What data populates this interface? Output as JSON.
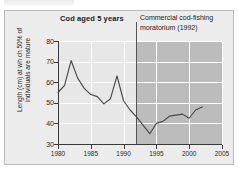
{
  "figure": {
    "clipped_caption": "",
    "title": "Cod aged 5 years",
    "annotation_line1": "Commercial cod-fishing",
    "annotation_line2": "moratorium (1992)",
    "axis_title_line1": "Length (cm) at wh ch 50% of",
    "axis_title_line2": "individuals are mature"
  },
  "colors": {
    "panel_bg": "#ececec",
    "plot_bg": "#e7e7e7",
    "shaded_region": "#bcbcbc",
    "gridline": "#ffffff",
    "axis": "#3a3a3a",
    "series_line": "#4a4a4a",
    "event_line": "#555555",
    "text": "#1a1a1a"
  },
  "chart_data": {
    "type": "line",
    "title": "Cod aged 5 years",
    "xlabel": "",
    "ylabel": "Length (cm) at wh ch 50% of individuals are mature",
    "xlim": [
      1980,
      2005
    ],
    "ylim": [
      30,
      80
    ],
    "grid": true,
    "legend": "none",
    "xticks": [
      1980,
      1985,
      1990,
      1995,
      2000,
      2005
    ],
    "yticks": [
      30,
      40,
      50,
      60,
      70,
      80
    ],
    "xtick_labels": [
      "1980",
      "1985",
      "1990",
      "1995",
      "2000",
      "2005"
    ],
    "ytick_labels": [
      "30",
      "40",
      "50",
      "60",
      "70",
      "80"
    ],
    "annotations": [
      {
        "text": "Commercial cod-fishing moratorium (1992)",
        "type": "vertical-line-with-shading",
        "x": 1992,
        "shaded_from": 1992,
        "shaded_to": 2005
      }
    ],
    "series": [
      {
        "name": "Length at which 50% of individuals are mature",
        "x": [
          1980,
          1981,
          1982,
          1983,
          1984,
          1985,
          1986,
          1987,
          1988,
          1989,
          1990,
          1991,
          1992,
          1993,
          1994,
          1995,
          1996,
          1997,
          1998,
          1999,
          2000,
          2001,
          2002
        ],
        "values": [
          55.0,
          58.5,
          70.5,
          62.0,
          57.0,
          54.0,
          53.0,
          49.5,
          52.0,
          63.0,
          51.0,
          46.5,
          43.0,
          39.0,
          35.0,
          40.0,
          41.0,
          43.5,
          44.0,
          44.5,
          42.5,
          46.5,
          48.0
        ]
      }
    ]
  }
}
